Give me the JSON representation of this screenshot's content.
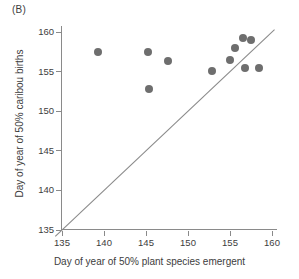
{
  "panel": {
    "label": "(B)"
  },
  "chart_data": {
    "type": "scatter",
    "title": "(B)",
    "xlabel": "Day of year of 50% plant species emergent",
    "ylabel": "Day of year of 50% caribou births",
    "xlim": [
      134,
      160.6
    ],
    "ylim": [
      134,
      161
    ],
    "xticks": [
      135,
      140,
      145,
      150,
      155,
      160
    ],
    "yticks": [
      135,
      140,
      145,
      150,
      155,
      160
    ],
    "xticklabels": [
      "135",
      "140",
      "145",
      "150",
      "155",
      "160"
    ],
    "yticklabels": [
      "135",
      "140",
      "145",
      "150",
      "155",
      "160"
    ],
    "grid": false,
    "legend": null,
    "marker": {
      "shape": "circle",
      "color": "#6e6e6e",
      "size_px": 8
    },
    "reference_line": {
      "name": "one-to-one-line",
      "type": "identity",
      "slope": 1,
      "intercept": 0,
      "color": "#8a8a8a",
      "x_start": 134.2,
      "y_start": 134.2,
      "x_end": 160.3,
      "y_end": 160.3
    },
    "points": [
      {
        "x": 139.3,
        "y": 157.5
      },
      {
        "x": 145.2,
        "y": 157.5
      },
      {
        "x": 145.3,
        "y": 152.8
      },
      {
        "x": 147.6,
        "y": 156.4
      },
      {
        "x": 152.9,
        "y": 155.1
      },
      {
        "x": 155.0,
        "y": 156.5
      },
      {
        "x": 155.6,
        "y": 158.0
      },
      {
        "x": 156.6,
        "y": 159.3
      },
      {
        "x": 156.8,
        "y": 155.4
      },
      {
        "x": 157.5,
        "y": 159.0
      },
      {
        "x": 158.5,
        "y": 155.4
      }
    ]
  }
}
